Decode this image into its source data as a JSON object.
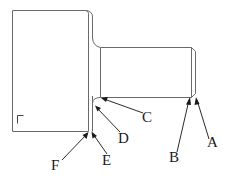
{
  "diagram": {
    "type": "technical-drawing",
    "line_color": "#6a6a6a",
    "text_color": "#1a1a1a",
    "labels": [
      {
        "id": "A",
        "text": "A",
        "points_to": "chamfer edge at end of small shaft"
      },
      {
        "id": "B",
        "text": "B",
        "points_to": "end face of small shaft"
      },
      {
        "id": "C",
        "text": "C",
        "points_to": "small shaft diameter near fillet"
      },
      {
        "id": "D",
        "text": "D",
        "points_to": "fillet between shaft and shoulder"
      },
      {
        "id": "E",
        "text": "E",
        "points_to": "shoulder face"
      },
      {
        "id": "F",
        "text": "F",
        "points_to": "shoulder corner edge of large section"
      }
    ],
    "corner_mark": "⌐"
  }
}
